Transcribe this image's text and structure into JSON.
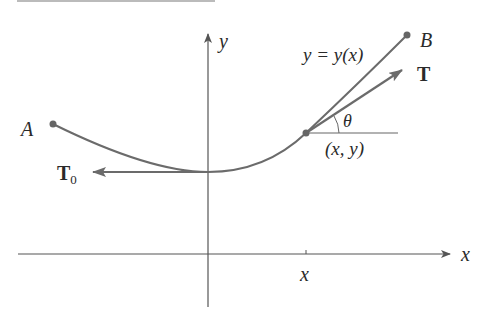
{
  "diagram": {
    "type": "hanging-cable-tension",
    "labels": {
      "point_a": "A",
      "point_b": "B",
      "curve_eq": "y = y(x)",
      "tension": "T",
      "tension_zero": "T",
      "tension_zero_sub": "0",
      "angle": "θ",
      "point_xy": "(x, y)",
      "axis_x": "x",
      "axis_y": "y",
      "tick_x": "x"
    },
    "colors": {
      "curve": "#6b6b6b",
      "axes": "#555555",
      "text": "#2a2a2a",
      "points": "#666666"
    }
  }
}
